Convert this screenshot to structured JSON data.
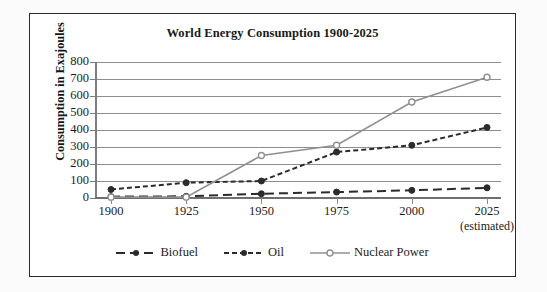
{
  "chart_data": {
    "type": "line",
    "title": "World Energy Consumption 1900-2025",
    "xlabel": "",
    "ylabel": "Consumption in Exajoules",
    "categories": [
      "1900",
      "1925",
      "1950",
      "1975",
      "2000",
      "2025"
    ],
    "x_note": "(estimated)",
    "ylim": [
      0,
      800
    ],
    "ytick_values": [
      800,
      700,
      600,
      500,
      400,
      300,
      200,
      100,
      0
    ],
    "ytick_labels": [
      "800",
      "700",
      "600",
      "500",
      "400",
      "300",
      "200",
      "100",
      "0"
    ],
    "grid": true,
    "legend_position": "bottom",
    "series": [
      {
        "name": "Biofuel",
        "values": [
          8,
          10,
          25,
          35,
          45,
          60
        ],
        "color": "#2b2b2b",
        "line_style": "long-dash",
        "marker": "filled-circle"
      },
      {
        "name": "Oil",
        "values": [
          50,
          90,
          100,
          270,
          310,
          415
        ],
        "color": "#2b2b2b",
        "line_style": "short-dash",
        "marker": "filled-circle"
      },
      {
        "name": "Nuclear Power",
        "values": [
          5,
          5,
          250,
          310,
          565,
          710
        ],
        "color": "#909090",
        "line_style": "solid",
        "marker": "open-circle"
      }
    ]
  },
  "colors": {
    "frame_border": "#2b2b2b",
    "gridline": "#8e8e8e",
    "axis": "#7d7d7d",
    "text": "#1c1c1c",
    "dark_series": "#2b2b2b",
    "gray_series": "#909090"
  }
}
